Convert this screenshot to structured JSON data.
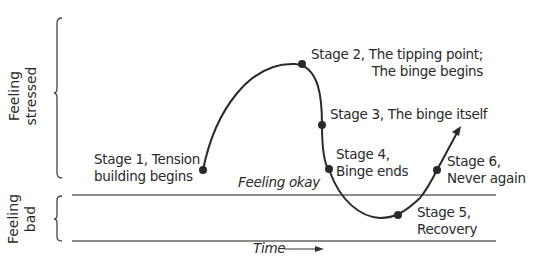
{
  "diagram": {
    "y_axis": {
      "upper_region": {
        "line1": "Feeling",
        "line2": "stressed"
      },
      "lower_region": {
        "line1": "Feeling",
        "line2": "bad"
      }
    },
    "baseline_label": "Feeling okay",
    "x_axis_label": "Time",
    "stages": [
      {
        "id": 1,
        "line1": "Stage 1, Tension",
        "line2": "building begins"
      },
      {
        "id": 2,
        "line1": "Stage 2, The tipping point;",
        "line2": "The binge begins"
      },
      {
        "id": 3,
        "line1": "Stage 3, The binge itself",
        "line2": ""
      },
      {
        "id": 4,
        "line1": "Stage 4,",
        "line2": "Binge ends"
      },
      {
        "id": 5,
        "line1": "Stage 5,",
        "line2": "Recovery"
      },
      {
        "id": 6,
        "line1": "Stage 6,",
        "line2": "Never again"
      }
    ],
    "colors": {
      "ink": "#2a2a2a",
      "line": "#555555",
      "background": "#ffffff"
    }
  }
}
